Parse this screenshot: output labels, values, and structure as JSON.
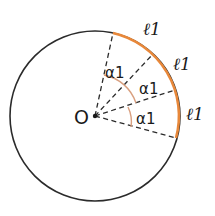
{
  "diagram": {
    "type": "circle-arc-diagram",
    "center_label": "O",
    "angle_labels": [
      "α1",
      "α1",
      "α1"
    ],
    "arc_labels": [
      "ℓ1",
      "ℓ1",
      "ℓ1"
    ],
    "colors": {
      "circle": "#2b2b2b",
      "arc_highlight": "#e8883a",
      "angle_mark": "#d9a080",
      "dashed_radius": "#2b2b2b"
    }
  }
}
